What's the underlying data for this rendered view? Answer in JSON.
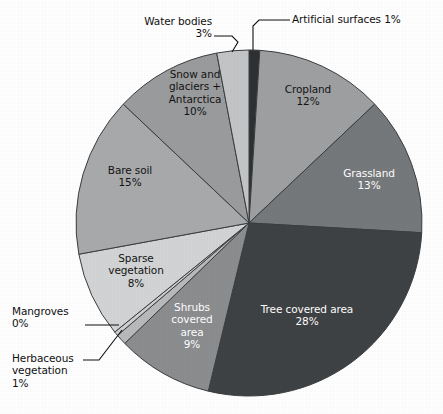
{
  "chart_data": {
    "type": "pie",
    "title": "",
    "subtitle": "",
    "xlabel": "",
    "ylabel": "",
    "legend_position": "none",
    "grid": false,
    "units": "percent",
    "start_angle_deg": 0,
    "direction": "clockwise",
    "total": 100,
    "categories": [
      "Artificial surfaces",
      "Cropland",
      "Grassland",
      "Tree covered area",
      "Shrubs covered area",
      "Herbaceous vegetation",
      "Mangroves",
      "Sparse vegetation",
      "Bare soil",
      "Snow and glaciers + Antarctica",
      "Water bodies"
    ],
    "values": [
      1,
      12,
      13,
      28,
      9,
      1,
      0.4,
      8,
      15,
      10,
      3
    ],
    "value_labels": [
      "1%",
      "12%",
      "13%",
      "28%",
      "9%",
      "1%",
      "0%",
      "8%",
      "15%",
      "10%",
      "3%"
    ],
    "colors": [
      "#2e3133",
      "#9fa0a2",
      "#76797b",
      "#3f4244",
      "#8b8d8f",
      "#b9babc",
      "#cfd0d1",
      "#d3d4d5",
      "#a9aaac",
      "#9b9c9e",
      "#c4c5c6"
    ],
    "slices": [
      {
        "name": "Artificial surfaces",
        "label": "Artificial surfaces 1%",
        "value": 1,
        "value_label": "1%",
        "color": "#2e3133",
        "label_placement": "outside",
        "label_text_color": "#111111"
      },
      {
        "name": "Cropland",
        "label": "Cropland\n12%",
        "value": 12,
        "value_label": "12%",
        "color": "#9fa0a2",
        "label_placement": "inside",
        "label_text_color": "#141414"
      },
      {
        "name": "Grassland",
        "label": "Grassland\n13%",
        "value": 13,
        "value_label": "13%",
        "color": "#76797b",
        "label_placement": "inside",
        "label_text_color": "#ffffff"
      },
      {
        "name": "Tree covered area",
        "label": "Tree covered area\n28%",
        "value": 28,
        "value_label": "28%",
        "color": "#3f4244",
        "label_placement": "inside",
        "label_text_color": "#ffffff"
      },
      {
        "name": "Shrubs covered area",
        "label": "Shrubs\ncovered\narea\n9%",
        "value": 9,
        "value_label": "9%",
        "color": "#8b8d8f",
        "label_placement": "inside",
        "label_text_color": "#ffffff"
      },
      {
        "name": "Herbaceous vegetation",
        "label": "Herbaceous\nvegetation\n1%",
        "value": 1,
        "value_label": "1%",
        "color": "#b9babc",
        "label_placement": "outside",
        "label_text_color": "#111111"
      },
      {
        "name": "Mangroves",
        "label": "Mangroves\n0%",
        "value": 0.4,
        "value_label": "0%",
        "color": "#cfd0d1",
        "label_placement": "outside",
        "label_text_color": "#111111"
      },
      {
        "name": "Sparse vegetation",
        "label": "Sparse\nvegetation\n8%",
        "value": 8,
        "value_label": "8%",
        "color": "#d3d4d5",
        "label_placement": "inside",
        "label_text_color": "#141414"
      },
      {
        "name": "Bare soil",
        "label": "Bare soil\n15%",
        "value": 15,
        "value_label": "15%",
        "color": "#a9aaac",
        "label_placement": "inside",
        "label_text_color": "#141414"
      },
      {
        "name": "Snow and glaciers + Antarctica",
        "label": "Snow and\nglaciers +\nAntarctica\n10%",
        "value": 10,
        "value_label": "10%",
        "color": "#9b9c9e",
        "label_placement": "inside",
        "label_text_color": "#141414"
      },
      {
        "name": "Water bodies",
        "label": "Water bodies\n3%",
        "value": 3,
        "value_label": "3%",
        "color": "#c4c5c6",
        "label_placement": "outside",
        "label_text_color": "#111111"
      }
    ]
  },
  "labels": {
    "artificial_surfaces": "Artificial surfaces 1%",
    "water_bodies": "Water bodies\n3%",
    "cropland": "Cropland\n12%",
    "grassland": "Grassland\n13%",
    "tree_covered_area": "Tree covered area\n28%",
    "shrubs_covered_area": "Shrubs\ncovered\narea\n9%",
    "herbaceous_vegetation": "Herbaceous\nvegetation\n1%",
    "mangroves": "Mangroves\n0%",
    "sparse_vegetation": "Sparse\nvegetation\n8%",
    "bare_soil": "Bare soil\n15%",
    "snow_and_glaciers": "Snow and\nglaciers +\nAntarctica\n10%"
  },
  "style": {
    "background": "#ffffff",
    "slice_stroke": "#3b3e40",
    "leader_line_color": "#111111",
    "center_x": 249,
    "center_y": 223,
    "radius": 173
  }
}
